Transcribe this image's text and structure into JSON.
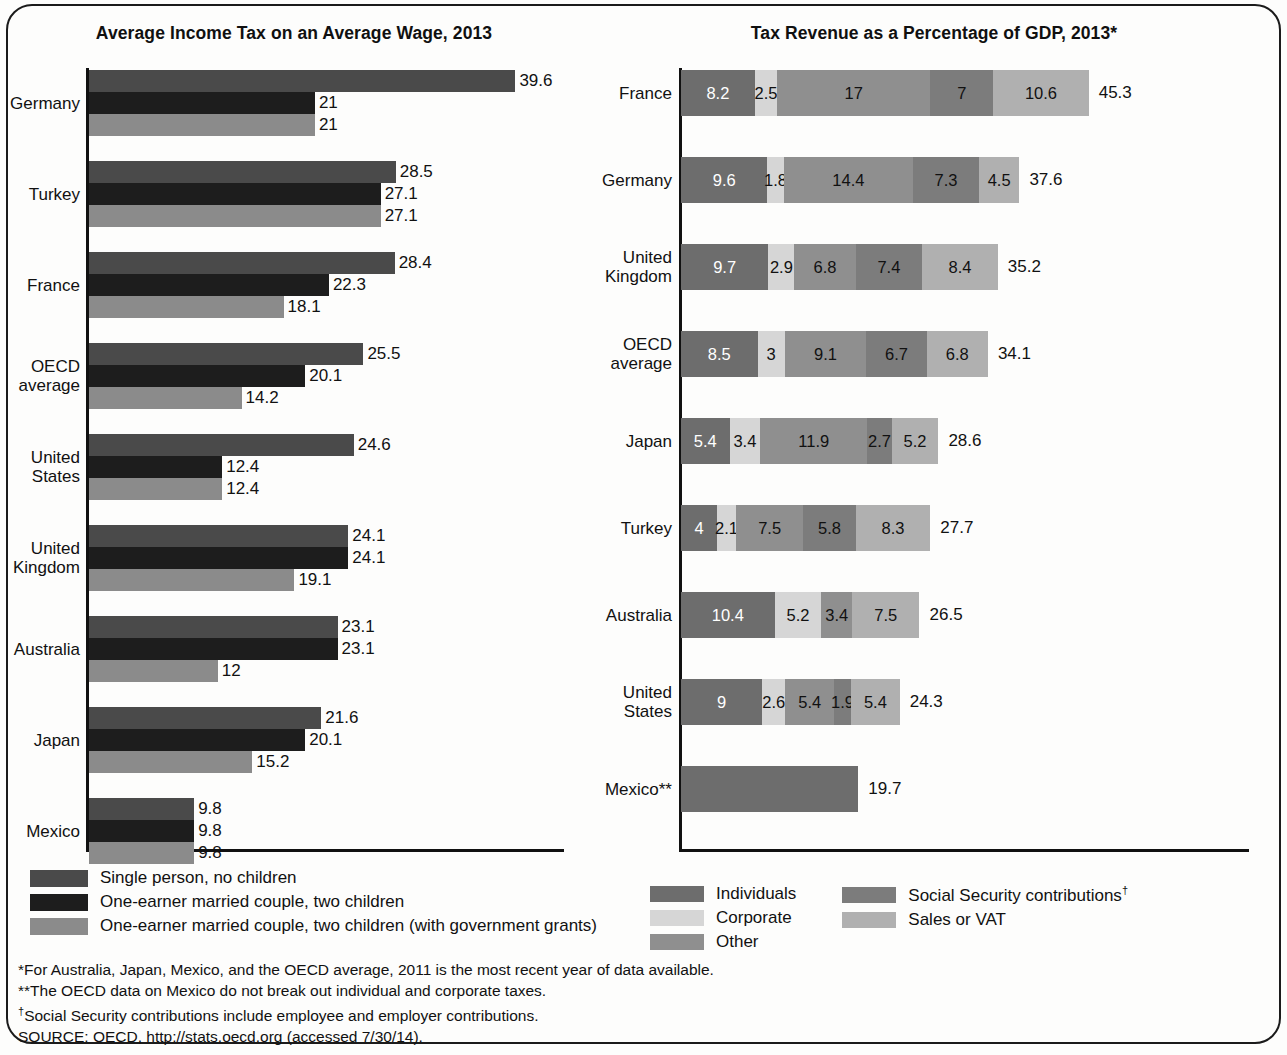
{
  "chart_data": [
    {
      "type": "bar",
      "orientation": "horizontal",
      "title": "Average Income Tax on an Average Wage, 2013",
      "xlabel": "",
      "ylabel": "",
      "grid": false,
      "legend_position": "bottom-left",
      "categories": [
        "Germany",
        "Turkey",
        "France",
        "OECD average",
        "United States",
        "United Kingdom",
        "Australia",
        "Japan",
        "Mexico"
      ],
      "series": [
        {
          "name": "Single person, no children",
          "color": "#4a4a4a",
          "values": [
            39.6,
            28.5,
            28.4,
            25.5,
            24.6,
            24.1,
            23.1,
            21.6,
            9.8
          ]
        },
        {
          "name": "One-earner married couple, two children",
          "color": "#1d1d1d",
          "values": [
            21,
            27.1,
            22.3,
            20.1,
            12.4,
            24.1,
            23.1,
            20.1,
            9.8
          ]
        },
        {
          "name": "One-earner married couple, two children (with government grants)",
          "color": "#8b8b8b",
          "values": [
            21,
            27.1,
            18.1,
            14.2,
            12.4,
            19.1,
            12,
            15.2,
            9.8
          ]
        }
      ],
      "labels": [
        [
          "39.6",
          "21",
          "21"
        ],
        [
          "28.5",
          "27.1",
          "27.1"
        ],
        [
          "28.4",
          "22.3",
          "18.1"
        ],
        [
          "25.5",
          "20.1",
          "14.2"
        ],
        [
          "24.6",
          "12.4",
          "12.4"
        ],
        [
          "24.1",
          "24.1",
          "19.1"
        ],
        [
          "23.1",
          "23.1",
          "12"
        ],
        [
          "21.6",
          "20.1",
          "15.2"
        ],
        [
          "9.8",
          "9.8",
          "9.8"
        ]
      ]
    },
    {
      "type": "bar",
      "subtype": "stacked",
      "orientation": "horizontal",
      "title": "Tax Revenue as a Percentage of GDP, 2013*",
      "xlabel": "",
      "ylabel": "",
      "grid": false,
      "legend_position": "bottom",
      "categories": [
        "France",
        "Germany",
        "United Kingdom",
        "OECD average",
        "Japan",
        "Turkey",
        "Australia",
        "United States",
        "Mexico**"
      ],
      "series": [
        {
          "name": "Individuals",
          "color": "#6d6d6d",
          "values": [
            8.2,
            9.6,
            9.7,
            8.5,
            5.4,
            4,
            10.4,
            9,
            19.7
          ]
        },
        {
          "name": "Corporate",
          "color": "#d6d6d6",
          "values": [
            2.5,
            1.8,
            2.9,
            3,
            3.4,
            2.1,
            5.2,
            2.6,
            0
          ]
        },
        {
          "name": "Other",
          "color": "#8f8f8f",
          "values": [
            17,
            14.4,
            6.8,
            9.1,
            11.9,
            7.5,
            3.4,
            5.4,
            0
          ]
        },
        {
          "name": "Social Security contributions",
          "color": "#7c7c7c",
          "values": [
            7,
            7.3,
            7.4,
            6.7,
            2.7,
            5.8,
            0,
            1.9,
            0
          ]
        },
        {
          "name": "Sales or VAT",
          "color": "#b0b0b0",
          "values": [
            10.6,
            4.5,
            8.4,
            6.8,
            5.2,
            8.3,
            7.5,
            5.4,
            0
          ]
        }
      ],
      "totals": [
        45.3,
        37.6,
        35.2,
        34.1,
        28.6,
        27.7,
        26.5,
        24.3,
        19.7
      ],
      "total_labels": [
        "45.3",
        "37.6",
        "35.2",
        "34.1",
        "28.6",
        "27.7",
        "26.5",
        "24.3",
        "19.7"
      ],
      "segment_labels": [
        [
          "8.2",
          "2.5",
          "17",
          "7",
          "10.6"
        ],
        [
          "9.6",
          "1.8",
          "14.4",
          "7.3",
          "4.5"
        ],
        [
          "9.7",
          "2.9",
          "6.8",
          "7.4",
          "8.4"
        ],
        [
          "8.5",
          "3",
          "9.1",
          "6.7",
          "6.8"
        ],
        [
          "5.4",
          "3.4",
          "11.9",
          "2.7",
          "5.2"
        ],
        [
          "4",
          "2.1",
          "7.5",
          "5.8",
          "8.3"
        ],
        [
          "10.4",
          "5.2",
          "3.4",
          "",
          "7.5"
        ],
        [
          "9",
          "2.6",
          "5.4",
          "1.9",
          "5.4"
        ],
        [
          "",
          "",
          "",
          "",
          ""
        ]
      ]
    }
  ],
  "left_chart": {
    "title": "Average Income Tax on an Average Wage, 2013",
    "rows": [
      {
        "label": "Germany",
        "label_lines": [
          "Germany"
        ],
        "values": [
          39.6,
          21,
          21
        ],
        "labels": [
          "39.6",
          "21",
          "21"
        ]
      },
      {
        "label": "Turkey",
        "label_lines": [
          "Turkey"
        ],
        "values": [
          28.5,
          27.1,
          27.1
        ],
        "labels": [
          "28.5",
          "27.1",
          "27.1"
        ]
      },
      {
        "label": "France",
        "label_lines": [
          "France"
        ],
        "values": [
          28.4,
          22.3,
          18.1
        ],
        "labels": [
          "28.4",
          "22.3",
          "18.1"
        ]
      },
      {
        "label": "OECD average",
        "label_lines": [
          "OECD",
          "average"
        ],
        "values": [
          25.5,
          20.1,
          14.2
        ],
        "labels": [
          "25.5",
          "20.1",
          "14.2"
        ]
      },
      {
        "label": "United States",
        "label_lines": [
          "United",
          "States"
        ],
        "values": [
          24.6,
          12.4,
          12.4
        ],
        "labels": [
          "24.6",
          "12.4",
          "12.4"
        ]
      },
      {
        "label": "United Kingdom",
        "label_lines": [
          "United",
          "Kingdom"
        ],
        "values": [
          24.1,
          24.1,
          19.1
        ],
        "labels": [
          "24.1",
          "24.1",
          "19.1"
        ]
      },
      {
        "label": "Australia",
        "label_lines": [
          "Australia"
        ],
        "values": [
          23.1,
          23.1,
          12
        ],
        "labels": [
          "23.1",
          "23.1",
          "12"
        ]
      },
      {
        "label": "Japan",
        "label_lines": [
          "Japan"
        ],
        "values": [
          21.6,
          20.1,
          15.2
        ],
        "labels": [
          "21.6",
          "20.1",
          "15.2"
        ]
      },
      {
        "label": "Mexico",
        "label_lines": [
          "Mexico"
        ],
        "values": [
          9.8,
          9.8,
          9.8
        ],
        "labels": [
          "9.8",
          "9.8",
          "9.8"
        ]
      }
    ],
    "legend": [
      {
        "label": "Single person, no children",
        "color": "#4a4a4a"
      },
      {
        "label": "One-earner married couple, two children",
        "color": "#1d1d1d"
      },
      {
        "label": "One-earner married couple, two children (with government grants)",
        "color": "#8b8b8b"
      }
    ]
  },
  "right_chart": {
    "title": "Tax Revenue as a Percentage of GDP, 2013*",
    "rows": [
      {
        "label": "France",
        "label_lines": [
          "France"
        ],
        "segments": [
          8.2,
          2.5,
          17,
          7,
          10.6
        ],
        "segment_labels": [
          "8.2",
          "2.5",
          "17",
          "7",
          "10.6"
        ],
        "total": 45.3,
        "total_label": "45.3"
      },
      {
        "label": "Germany",
        "label_lines": [
          "Germany"
        ],
        "segments": [
          9.6,
          1.8,
          14.4,
          7.3,
          4.5
        ],
        "segment_labels": [
          "9.6",
          "1.8",
          "14.4",
          "7.3",
          "4.5"
        ],
        "total": 37.6,
        "total_label": "37.6"
      },
      {
        "label": "United Kingdom",
        "label_lines": [
          "United",
          "Kingdom"
        ],
        "segments": [
          9.7,
          2.9,
          6.8,
          7.4,
          8.4
        ],
        "segment_labels": [
          "9.7",
          "2.9",
          "6.8",
          "7.4",
          "8.4"
        ],
        "total": 35.2,
        "total_label": "35.2"
      },
      {
        "label": "OECD average",
        "label_lines": [
          "OECD",
          "average"
        ],
        "segments": [
          8.5,
          3,
          9.1,
          6.7,
          6.8
        ],
        "segment_labels": [
          "8.5",
          "3",
          "9.1",
          "6.7",
          "6.8"
        ],
        "total": 34.1,
        "total_label": "34.1"
      },
      {
        "label": "Japan",
        "label_lines": [
          "Japan"
        ],
        "segments": [
          5.4,
          3.4,
          11.9,
          2.7,
          5.2
        ],
        "segment_labels": [
          "5.4",
          "3.4",
          "11.9",
          "2.7",
          "5.2"
        ],
        "total": 28.6,
        "total_label": "28.6"
      },
      {
        "label": "Turkey",
        "label_lines": [
          "Turkey"
        ],
        "segments": [
          4,
          2.1,
          7.5,
          5.8,
          8.3
        ],
        "segment_labels": [
          "4",
          "2.1",
          "7.5",
          "5.8",
          "8.3"
        ],
        "total": 27.7,
        "total_label": "27.7"
      },
      {
        "label": "Australia",
        "label_lines": [
          "Australia"
        ],
        "segments": [
          10.4,
          5.2,
          3.4,
          0,
          7.5
        ],
        "segment_labels": [
          "10.4",
          "5.2",
          "3.4",
          "",
          "7.5"
        ],
        "total": 26.5,
        "total_label": "26.5"
      },
      {
        "label": "United States",
        "label_lines": [
          "United",
          "States"
        ],
        "segments": [
          9,
          2.6,
          5.4,
          1.9,
          5.4
        ],
        "segment_labels": [
          "9",
          "2.6",
          "5.4",
          "1.9",
          "5.4"
        ],
        "total": 24.3,
        "total_label": "24.3"
      },
      {
        "label": "Mexico**",
        "label_lines": [
          "Mexico**"
        ],
        "segments": [
          19.7,
          0,
          0,
          0,
          0
        ],
        "segment_labels": [
          "",
          "",
          "",
          "",
          ""
        ],
        "total": 19.7,
        "total_label": "19.7"
      }
    ],
    "legend_col1": [
      {
        "label": "Individuals",
        "color": "#6d6d6d"
      },
      {
        "label": "Corporate",
        "color": "#d6d6d6"
      },
      {
        "label": "Other",
        "color": "#8f8f8f"
      }
    ],
    "legend_col2": [
      {
        "label": "Social Security contributions",
        "sup": "†",
        "color": "#7c7c7c"
      },
      {
        "label": "Sales or VAT",
        "sup": "",
        "color": "#b0b0b0"
      }
    ]
  },
  "footnotes": [
    {
      "marker": "*",
      "text": "For Australia, Japan, Mexico, and the OECD average, 2011 is the most recent year of data available."
    },
    {
      "marker": "**",
      "text": "The OECD data on Mexico do not break out individual and corporate taxes."
    },
    {
      "marker": "†",
      "text": "Social Security contributions include employee and employer contributions."
    },
    {
      "marker": "",
      "text": "SOURCE: OECD, http://stats.oecd.org (accessed 7/30/14)."
    }
  ]
}
